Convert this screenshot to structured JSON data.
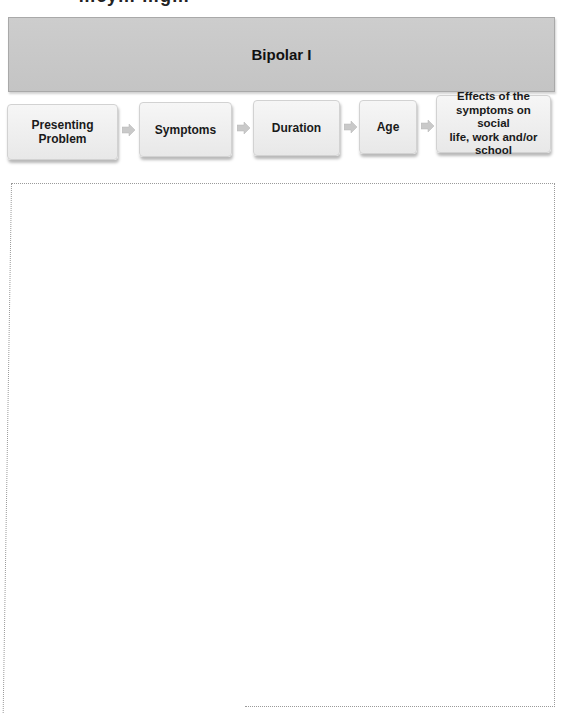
{
  "page": {
    "cut_heading_fragment": "…cy… …g…"
  },
  "header": {
    "title": "Bipolar I"
  },
  "flow": {
    "steps": [
      {
        "label_lines": [
          "Presenting",
          "Problem"
        ]
      },
      {
        "label_lines": [
          "Symptoms"
        ]
      },
      {
        "label_lines": [
          "Duration"
        ]
      },
      {
        "label_lines": [
          "Age"
        ]
      },
      {
        "label_lines": [
          "Effects of the",
          "symptoms  on social",
          "life, work and/or",
          "school"
        ]
      }
    ],
    "arrow_icon": "right-arrow-icon"
  },
  "answer_area": {
    "content": ""
  },
  "colors": {
    "header_bg": "#c8c8c8",
    "box_bg": "#eeeeee",
    "arrow": "#c9c9c9",
    "dotted_border": "#9a9a9a"
  }
}
